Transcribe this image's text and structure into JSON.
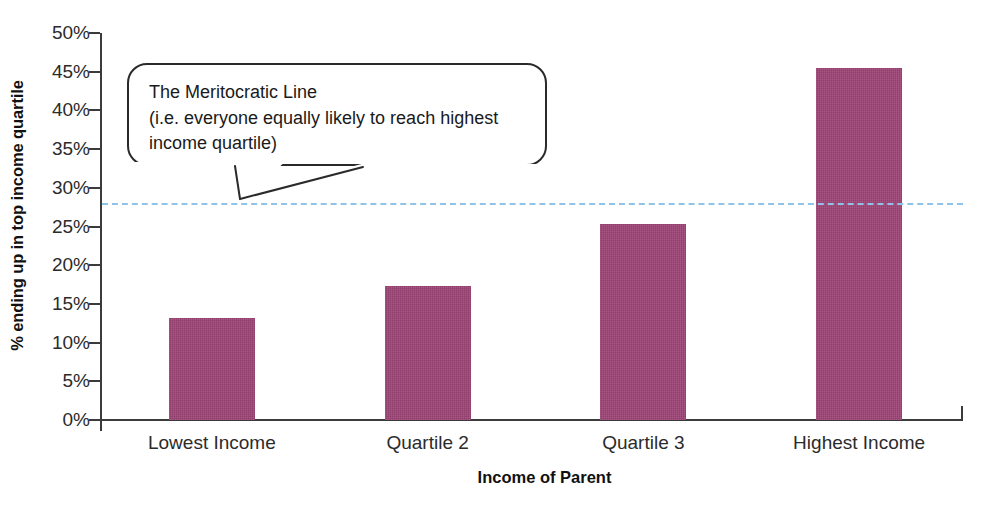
{
  "chart_data": {
    "type": "bar",
    "title": "",
    "subtitle": "",
    "xlabel": "Income of Parent",
    "ylabel": "% ending up in top income quartile",
    "categories": [
      "Lowest Income",
      "Quartile 2",
      "Quartile 3",
      "Highest Income"
    ],
    "values": [
      13.2,
      17.3,
      25.3,
      45.5
    ],
    "value_unit": "%",
    "ylim": [
      0,
      50
    ],
    "ytick_step": 5,
    "ytick_labels": [
      "0%",
      "5%",
      "10%",
      "15%",
      "20%",
      "25%",
      "30%",
      "35%",
      "40%",
      "45%",
      "50%"
    ],
    "ytick_values": [
      0,
      5,
      10,
      15,
      20,
      25,
      30,
      35,
      40,
      45,
      50
    ],
    "grid": false,
    "legend": "none",
    "bar_color": "#9e4577",
    "series": [
      {
        "name": "% ending up in top income quartile",
        "values": [
          13.2,
          17.3,
          25.3,
          45.5
        ]
      }
    ],
    "reference_line": {
      "label": "The Meritocratic Line",
      "value": 28.0,
      "style": "dashed",
      "color": "#8fc4e8"
    },
    "annotations": [
      {
        "name": "meritocratic-line-callout",
        "lines": [
          "The Meritocratic Line",
          "(i.e. everyone equally likely to reach highest",
          "income quartile)"
        ]
      }
    ]
  },
  "axes": {
    "y_title": "% ending up in top income quartile",
    "x_title": "Income of Parent"
  },
  "callout": {
    "line1": "The Meritocratic Line",
    "line2": "(i.e. everyone equally likely to reach highest",
    "line3": "income quartile)"
  },
  "colors": {
    "bar": "#9e4577",
    "reference_line": "#8fc4e8",
    "axis": "#3b3b3b",
    "text": "#1a1a1a"
  }
}
